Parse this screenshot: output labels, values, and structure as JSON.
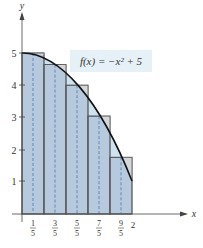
{
  "figure": {
    "function_label": "f(x) = −x² + 5",
    "x_axis_label": "x",
    "y_axis_label": "y",
    "y_ticks": [
      "1",
      "2",
      "3",
      "4",
      "5"
    ],
    "x_ticks": [
      {
        "num": "1",
        "den": "5"
      },
      {
        "num": "3",
        "den": "5"
      },
      {
        "num": "5",
        "den": "5"
      },
      {
        "num": "7",
        "den": "5"
      },
      {
        "num": "9",
        "den": "5"
      }
    ],
    "x_end_tick": "2",
    "rect_heights": [
      5,
      4.64,
      4,
      3.04,
      1.76
    ],
    "colors": {
      "rect_fill": "#b7c9dc",
      "rect_stroke": "#555555",
      "overflow_fill": "#d4d7da",
      "underflow_fill": "#cfe3ef",
      "curve": "#111111",
      "label_bg": "#e6f1f7",
      "dash": "#3a6fb0"
    }
  }
}
